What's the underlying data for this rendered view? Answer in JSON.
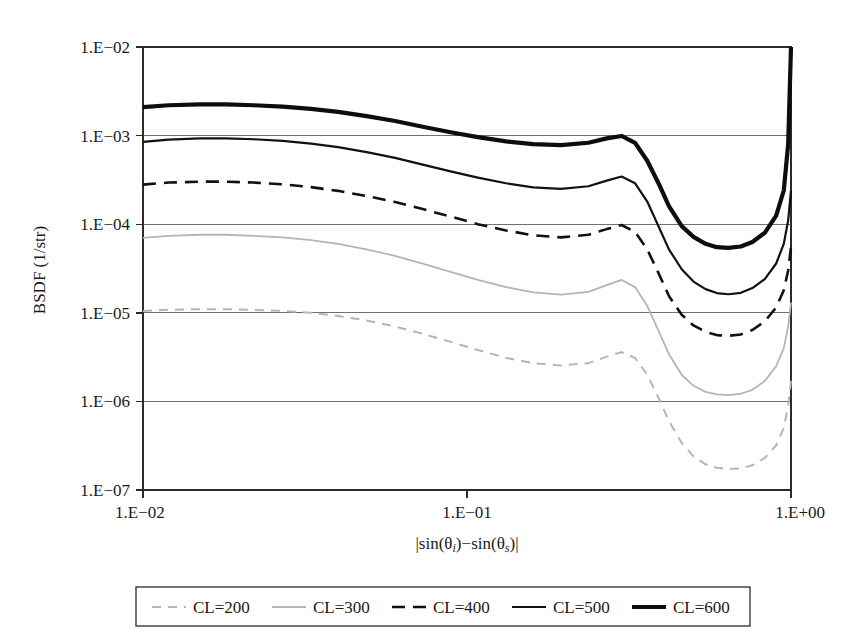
{
  "chart_data": {
    "type": "line",
    "title": "",
    "xlabel": "|sin(θi)−sin(θs)|",
    "ylabel": "BSDF (1/str)",
    "xscale": "log",
    "yscale": "log",
    "xlim": [
      0.01,
      1.0
    ],
    "ylim": [
      1e-07,
      0.01
    ],
    "xtick_labels": [
      "1.E−02",
      "1.E−01",
      "1.E+00"
    ],
    "xticks": [
      0.01,
      0.1,
      1.0
    ],
    "ytick_labels": [
      "1.E−02",
      "1.E−03",
      "1.E−04",
      "1.E−05",
      "1.E−06",
      "1.E−07"
    ],
    "yticks": [
      0.01,
      0.001,
      0.0001,
      1e-05,
      1e-06,
      1e-07
    ],
    "grid": "horizontal",
    "legend_position": "below",
    "x": [
      0.01,
      0.012,
      0.015,
      0.018,
      0.022,
      0.027,
      0.033,
      0.04,
      0.049,
      0.06,
      0.073,
      0.089,
      0.108,
      0.132,
      0.16,
      0.195,
      0.237,
      0.27,
      0.3,
      0.33,
      0.36,
      0.39,
      0.42,
      0.46,
      0.5,
      0.545,
      0.59,
      0.64,
      0.7,
      0.76,
      0.83,
      0.9,
      0.95,
      0.98,
      1.0
    ],
    "series": [
      {
        "name": "CL=200",
        "style": "dashed-light",
        "color": "#b5b5b5",
        "width": 2.0,
        "dash": "9,7",
        "values": [
          1.05e-05,
          1.08e-05,
          1.1e-05,
          1.1e-05,
          1.08e-05,
          1.05e-05,
          1e-05,
          9.2e-06,
          8.2e-06,
          7e-06,
          5.8e-06,
          4.7e-06,
          3.8e-06,
          3.1e-06,
          2.7e-06,
          2.55e-06,
          2.7e-06,
          3.2e-06,
          3.6e-06,
          3.1e-06,
          2e-06,
          1.1e-06,
          6e-07,
          3.4e-07,
          2.4e-07,
          1.95e-07,
          1.78e-07,
          1.72e-07,
          1.75e-07,
          1.9e-07,
          2.3e-07,
          3.2e-07,
          5e-07,
          9e-07,
          1.7e-06
        ]
      },
      {
        "name": "CL=300",
        "style": "solid-light",
        "color": "#b5b5b5",
        "width": 1.8,
        "dash": "none",
        "values": [
          7e-05,
          7.4e-05,
          7.6e-05,
          7.6e-05,
          7.4e-05,
          7.1e-05,
          6.6e-05,
          6e-05,
          5.2e-05,
          4.4e-05,
          3.6e-05,
          2.9e-05,
          2.35e-05,
          1.95e-05,
          1.7e-05,
          1.6e-05,
          1.72e-05,
          2.05e-05,
          2.35e-05,
          1.95e-05,
          1.2e-05,
          6.3e-06,
          3.4e-06,
          2e-06,
          1.5e-06,
          1.28e-06,
          1.2e-06,
          1.18e-06,
          1.22e-06,
          1.35e-06,
          1.7e-06,
          2.5e-06,
          4e-06,
          7e-06,
          1.3e-05
        ]
      },
      {
        "name": "CL=400",
        "style": "dash-dot-dark",
        "color": "#111111",
        "width": 2.6,
        "dash": "13,8",
        "values": [
          0.00028,
          0.000295,
          0.000302,
          0.000302,
          0.000295,
          0.000282,
          0.000262,
          0.000238,
          0.000208,
          0.000178,
          0.000148,
          0.000122,
          0.0001,
          8.5e-05,
          7.5e-05,
          7.1e-05,
          7.6e-05,
          8.8e-05,
          9.8e-05,
          8.2e-05,
          5.2e-05,
          2.8e-05,
          1.55e-05,
          9.5e-06,
          7.2e-06,
          6.1e-06,
          5.6e-06,
          5.5e-06,
          5.7e-06,
          6.4e-06,
          8e-06,
          1.15e-05,
          1.8e-05,
          3e-05,
          5.5e-05
        ]
      },
      {
        "name": "CL=500",
        "style": "solid-dark",
        "color": "#111111",
        "width": 2.2,
        "dash": "none",
        "values": [
          0.00085,
          0.0009,
          0.00093,
          0.00093,
          0.00091,
          0.00087,
          0.00081,
          0.00074,
          0.00065,
          0.00056,
          0.00047,
          0.000395,
          0.000335,
          0.00029,
          0.00026,
          0.00025,
          0.000268,
          0.00031,
          0.000345,
          0.00029,
          0.00018,
          9.5e-05,
          5.2e-05,
          3.1e-05,
          2.25e-05,
          1.85e-05,
          1.67e-05,
          1.62e-05,
          1.68e-05,
          1.9e-05,
          2.4e-05,
          3.6e-05,
          6e-05,
          0.00011,
          0.00024
        ]
      },
      {
        "name": "CL=600",
        "style": "solid-bold",
        "color": "#0d0d0d",
        "width": 4.2,
        "dash": "none",
        "values": [
          0.0021,
          0.0022,
          0.00225,
          0.00225,
          0.0022,
          0.00212,
          0.002,
          0.00185,
          0.00166,
          0.00146,
          0.00126,
          0.00109,
          0.00096,
          0.00086,
          0.0008,
          0.00078,
          0.00083,
          0.00093,
          0.00099,
          0.00083,
          0.00052,
          0.00029,
          0.00016,
          9.5e-05,
          7.2e-05,
          6e-05,
          5.5e-05,
          5.4e-05,
          5.6e-05,
          6.3e-05,
          8e-05,
          0.000125,
          0.00024,
          0.0008,
          0.01
        ]
      }
    ]
  },
  "legend": {
    "entries": [
      {
        "label": "CL=200"
      },
      {
        "label": "CL=300"
      },
      {
        "label": "CL=400"
      },
      {
        "label": "CL=500"
      },
      {
        "label": "CL=600"
      }
    ]
  },
  "xaxis_label_parts": {
    "bar_left": "|",
    "sin_i": "sin(θ",
    "sub_i": "i",
    "close_i": ")",
    "minus": "−",
    "sin_s": "sin(θ",
    "sub_s": "s",
    "close_s": ")",
    "bar_right": "|"
  }
}
